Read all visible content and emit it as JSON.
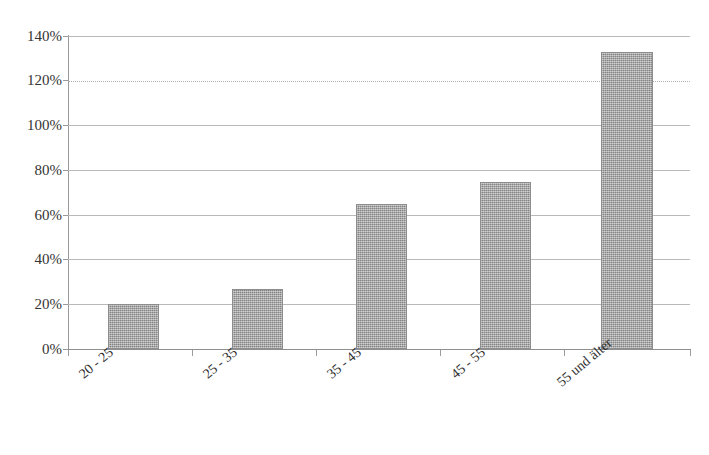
{
  "chart_data": {
    "type": "bar",
    "title": "",
    "xlabel": "",
    "ylabel": "",
    "categories": [
      "20 - 25",
      "25 - 35",
      "35 - 45",
      "45 - 55",
      "55 und älter"
    ],
    "values": [
      20,
      27,
      65,
      74.5,
      133
    ],
    "value_unit": "%",
    "ylim": [
      0,
      140
    ],
    "ytick_step": 20,
    "yticks": [
      "140%",
      "120%",
      "100%",
      "80%",
      "60%",
      "40%",
      "20%",
      "0%"
    ],
    "ytick_values": [
      140,
      120,
      100,
      80,
      60,
      40,
      20,
      0
    ],
    "grid": true,
    "legend": false,
    "series": [
      {
        "name": "",
        "values": [
          20,
          27,
          65,
          74.5,
          133
        ]
      }
    ],
    "colors": {
      "bar_fill": "#a2a2a2",
      "bar_border": "#8d8d8d",
      "gridline": "#b9b9b9",
      "axis": "#8f8f8f",
      "text": "#2f2f2f",
      "background": "#ffffff"
    }
  }
}
